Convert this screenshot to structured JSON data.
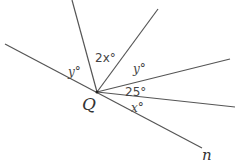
{
  "diagram": {
    "vertex_label": "Q",
    "line_label": "n",
    "angles": [
      {
        "id": "left-y",
        "label": "y°"
      },
      {
        "id": "two-x",
        "label": "2x°"
      },
      {
        "id": "upper-y",
        "label": "y°"
      },
      {
        "id": "twenty-five",
        "label": "25°"
      },
      {
        "id": "x",
        "label": "x°"
      }
    ],
    "line_color": "#555555"
  }
}
